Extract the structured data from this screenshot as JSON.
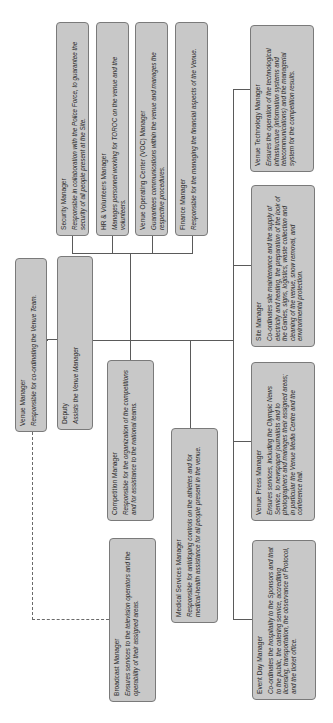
{
  "chart_title": "Venue Team organisation chart",
  "orientation": "rotated -90deg",
  "colors": {
    "box_fill": "#c8c8c8",
    "box_border": "#7a7a7a",
    "line": "#5a5a5a",
    "background": "#ffffff"
  },
  "nodes": {
    "venue_manager": {
      "title": "Venue Manager",
      "desc": "Responsible for co-ordinating the Venue Team."
    },
    "deputy": {
      "title": "Deputy",
      "desc": "Assists the Venue Manager"
    },
    "security": {
      "title": "Security Manager",
      "desc": "Responsible in collaboration with the Police Force, to guarantee the security of all people present at the Site."
    },
    "hr": {
      "title": "HR & Volunteers Manager",
      "desc": "Manages personnel working for TOROC on the venue and the volunteers."
    },
    "voc": {
      "title": "Venue Operating Center (VOC) Manager",
      "desc": "Guarantees communications within the venue and manages the respective procedures."
    },
    "finance": {
      "title": "Finance Manager",
      "desc": "Responsible for the managing the financial aspects of the Venue."
    },
    "competition": {
      "title": "Competition Manager",
      "desc": "Responsible for the organization of the competitions and for assistance to the national teams."
    },
    "broadcast": {
      "title": "Broadcast Manager",
      "desc": "Ensures services to the television operators and the operability of their assigned areas."
    },
    "medical": {
      "title": "Medical Services Manager",
      "desc": "Responsible for antidoping controls on the athletes and for medical-health assistance for all people present in the venue."
    },
    "technology": {
      "title": "Venue Technology Manager",
      "desc": "Ensures the operation of the technological infrastructure (information systems and telecommunications) and the managerial system for the competition results."
    },
    "site": {
      "title": "Site Manager",
      "desc": "Co-ordinates site maintenance and the supply of electricity and heating, the preparation of the look of the Games, signs, logistics, waste collection and cleaning of the venue, snow removal, and environmental protection."
    },
    "press": {
      "title": "Venue Press Manager",
      "desc": "Ensures services, including the Olympic News Service, to newspaper journalists and to photographers and manages their assigned areas; in particular the Venue Media Centre and the conference hall."
    },
    "event_day": {
      "title": "Event Day Manager",
      "desc": "Co-ordinates the hospitality to the Sponsors and that to the public, the catering service, accrediting licensing, transportation, the observance of Protocol, and the ticket office."
    }
  }
}
